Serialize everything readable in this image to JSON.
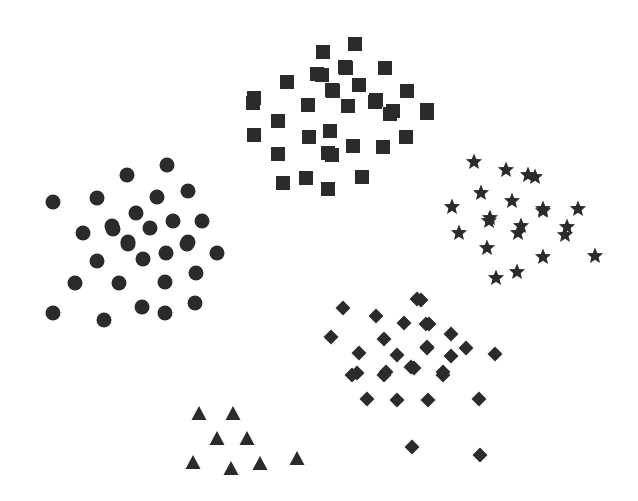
{
  "canvas": {
    "width": 638,
    "height": 501,
    "background_color": "#ffffff"
  },
  "chart_data": {
    "type": "scatter",
    "title": "",
    "subtitle": "",
    "xlabel": "",
    "ylabel": "",
    "xlim": [
      0,
      638
    ],
    "ylim": [
      0,
      501
    ],
    "grid": false,
    "axes_visible": false,
    "tick_labels": {
      "x": [],
      "y": []
    },
    "legend": {
      "visible": false,
      "position": "none",
      "entries": []
    },
    "annotations": [],
    "note": "Five unlabeled point clusters distinguished only by marker glyph; coordinates are in pixel space with origin at top-left.",
    "marker_color": "#2b2b2b",
    "series": [
      {
        "name": "cluster-circles",
        "marker": "circle",
        "color": "#2b2b2b",
        "size": 15,
        "count": 30,
        "points": [
          [
            52.7,
            202.3
          ],
          [
            96.7,
            198.3
          ],
          [
            126.7,
            175.0
          ],
          [
            83.3,
            233.3
          ],
          [
            113.3,
            229.3
          ],
          [
            167.3,
            165.0
          ],
          [
            188.3,
            190.7
          ],
          [
            156.7,
            197.3
          ],
          [
            136.0,
            212.7
          ],
          [
            173.3,
            220.7
          ],
          [
            201.7,
            220.7
          ],
          [
            150.0,
            228.3
          ],
          [
            111.7,
            226.0
          ],
          [
            128.3,
            241.7
          ],
          [
            188.3,
            241.7
          ],
          [
            97.3,
            260.7
          ],
          [
            75.0,
            283.3
          ],
          [
            119.3,
            282.7
          ],
          [
            52.7,
            312.7
          ],
          [
            104.0,
            320.0
          ],
          [
            166.0,
            252.7
          ],
          [
            186.7,
            244.0
          ],
          [
            143.3,
            259.3
          ],
          [
            216.7,
            253.3
          ],
          [
            196.0,
            273.3
          ],
          [
            165.0,
            281.7
          ],
          [
            141.7,
            306.7
          ],
          [
            195.0,
            302.7
          ],
          [
            165.0,
            313.3
          ],
          [
            128.3,
            244.0
          ]
        ]
      },
      {
        "name": "cluster-squares",
        "marker": "square",
        "color": "#2b2b2b",
        "size": 14,
        "count": 37,
        "points": [
          [
            323.3,
            51.7
          ],
          [
            316.7,
            74.3
          ],
          [
            286.7,
            82.3
          ],
          [
            332.7,
            91.0
          ],
          [
            254.3,
            97.7
          ],
          [
            307.7,
            105.0
          ],
          [
            345.0,
            66.7
          ],
          [
            355.0,
            44.3
          ],
          [
            346.0,
            68.3
          ],
          [
            385.0,
            68.3
          ],
          [
            321.7,
            75.0
          ],
          [
            359.3,
            85.0
          ],
          [
            331.7,
            90.0
          ],
          [
            407.3,
            90.7
          ],
          [
            376.0,
            100.0
          ],
          [
            348.3,
            106.0
          ],
          [
            392.7,
            111.0
          ],
          [
            426.7,
            110.0
          ],
          [
            253.3,
            102.7
          ],
          [
            308.3,
            105.0
          ],
          [
            277.7,
            120.7
          ],
          [
            254.3,
            135.0
          ],
          [
            309.0,
            136.7
          ],
          [
            330.0,
            130.7
          ],
          [
            278.3,
            154.0
          ],
          [
            332.3,
            155.0
          ],
          [
            305.7,
            178.3
          ],
          [
            283.3,
            183.3
          ],
          [
            328.3,
            189.3
          ],
          [
            375.0,
            101.7
          ],
          [
            390.0,
            114.0
          ],
          [
            427.3,
            113.3
          ],
          [
            406.0,
            136.7
          ],
          [
            353.3,
            146.0
          ],
          [
            383.3,
            146.7
          ],
          [
            328.3,
            152.7
          ],
          [
            361.7,
            177.3
          ]
        ]
      },
      {
        "name": "cluster-stars",
        "marker": "star",
        "color": "#2b2b2b",
        "size": 17,
        "count": 22,
        "points": [
          [
            474.0,
            161.7
          ],
          [
            506.0,
            170.0
          ],
          [
            480.7,
            192.7
          ],
          [
            511.7,
            200.7
          ],
          [
            451.7,
            207.3
          ],
          [
            490.0,
            218.3
          ],
          [
            528.3,
            175.0
          ],
          [
            535.0,
            176.7
          ],
          [
            543.3,
            209.3
          ],
          [
            578.3,
            209.3
          ],
          [
            520.7,
            226.0
          ],
          [
            566.7,
            227.3
          ],
          [
            489.3,
            220.7
          ],
          [
            459.3,
            232.7
          ],
          [
            518.3,
            232.7
          ],
          [
            487.3,
            248.3
          ],
          [
            496.0,
            278.3
          ],
          [
            517.3,
            271.7
          ],
          [
            542.7,
            210.7
          ],
          [
            565.0,
            235.0
          ],
          [
            542.7,
            257.3
          ],
          [
            595.0,
            256.0
          ]
        ]
      },
      {
        "name": "cluster-diamonds",
        "marker": "diamond",
        "color": "#2b2b2b",
        "size": 15,
        "count": 31,
        "points": [
          [
            343.3,
            307.7
          ],
          [
            376.0,
            315.7
          ],
          [
            417.3,
            299.0
          ],
          [
            404.0,
            323.3
          ],
          [
            330.7,
            336.7
          ],
          [
            384.0,
            339.0
          ],
          [
            359.3,
            353.3
          ],
          [
            397.3,
            355.0
          ],
          [
            426.0,
            324.3
          ],
          [
            426.7,
            346.7
          ],
          [
            356.7,
            373.3
          ],
          [
            386.0,
            372.3
          ],
          [
            410.7,
            366.7
          ],
          [
            420.7,
            300.0
          ],
          [
            429.3,
            324.3
          ],
          [
            450.7,
            334.3
          ],
          [
            427.3,
            347.7
          ],
          [
            466.0,
            347.7
          ],
          [
            450.7,
            355.7
          ],
          [
            495.0,
            354.3
          ],
          [
            414.0,
            368.3
          ],
          [
            443.3,
            372.3
          ],
          [
            351.7,
            375.0
          ],
          [
            366.7,
            399.3
          ],
          [
            397.3,
            400.0
          ],
          [
            428.3,
            400.0
          ],
          [
            479.3,
            399.3
          ],
          [
            411.7,
            447.3
          ],
          [
            480.0,
            455.0
          ],
          [
            384.0,
            375.0
          ],
          [
            443.3,
            375.0
          ]
        ]
      },
      {
        "name": "cluster-triangles",
        "marker": "triangle",
        "color": "#2b2b2b",
        "size": 16,
        "count": 8,
        "points": [
          [
            199.3,
            413.3
          ],
          [
            232.7,
            413.3
          ],
          [
            216.7,
            438.3
          ],
          [
            247.3,
            438.3
          ],
          [
            193.3,
            461.7
          ],
          [
            230.7,
            468.3
          ],
          [
            260.0,
            462.7
          ],
          [
            296.7,
            458.3
          ]
        ]
      }
    ]
  }
}
